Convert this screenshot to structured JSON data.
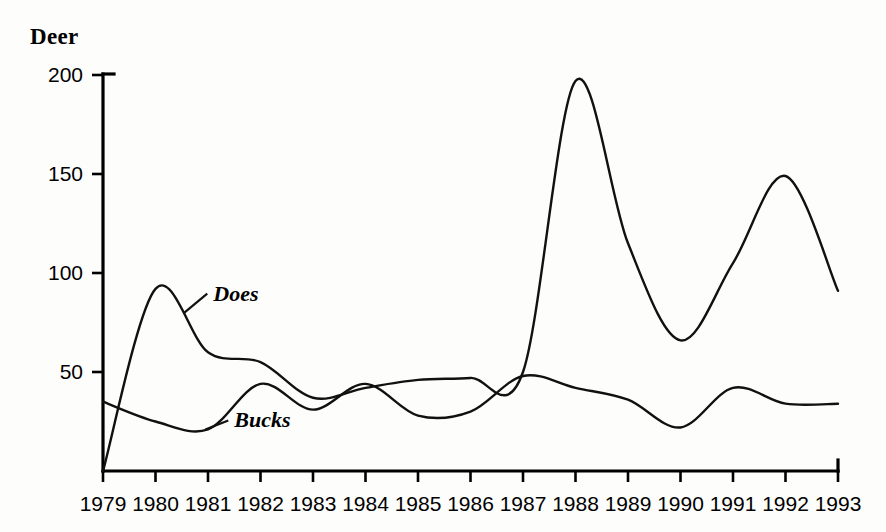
{
  "chart_data": {
    "type": "line",
    "title": "Deer",
    "xlabel": "",
    "ylabel": "Deer",
    "x": [
      1979,
      1980,
      1981,
      1982,
      1983,
      1984,
      1985,
      1986,
      1987,
      1988,
      1989,
      1990,
      1991,
      1992,
      1993
    ],
    "xtick_labels": [
      "1979",
      "1980",
      "1981",
      "1982",
      "1983",
      "1984",
      "1985",
      "1986",
      "1987",
      "1988",
      "1989",
      "1990",
      "1991",
      "1992",
      "1993"
    ],
    "ytick_labels": [
      "50",
      "100",
      "150",
      "200"
    ],
    "yticks": [
      50,
      100,
      150,
      200
    ],
    "xlim": [
      1979,
      1993
    ],
    "ylim": [
      0,
      200
    ],
    "grid": false,
    "legend_position": "inline-annotations",
    "series": [
      {
        "name": "Does",
        "label": "Does",
        "color": "#111111",
        "values": [
          0,
          92,
          60,
          55,
          37,
          42,
          46,
          47,
          50,
          197,
          115,
          66,
          105,
          149,
          91
        ]
      },
      {
        "name": "Bucks",
        "label": "Bucks",
        "color": "#111111",
        "values": [
          35,
          25,
          21,
          44,
          31,
          44,
          28,
          30,
          48,
          42,
          36,
          22,
          42,
          34,
          34
        ]
      }
    ],
    "annotations": [
      {
        "text": "Does",
        "x": 1981.1,
        "y": 86,
        "leader_to_x": 1980.55,
        "leader_to_y": 80
      },
      {
        "text": "Bucks",
        "x": 1981.5,
        "y": 22,
        "leader_to_x": 1980.95,
        "leader_to_y": 21
      }
    ]
  },
  "axes": {
    "y_axis_name": "y-axis",
    "x_axis_name": "x-axis"
  }
}
